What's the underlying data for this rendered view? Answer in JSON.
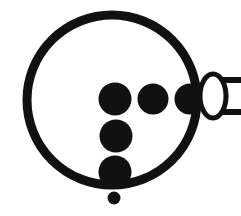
{
  "figure": {
    "title": "Circular pictogram with dot cluster and handle",
    "width": 241,
    "height": 216,
    "background_color": "#ffffff",
    "ink_color": "#111111"
  },
  "shapes": {
    "outer_circle": {
      "label": "outer circle outline",
      "cx": 112,
      "cy": 100,
      "r": 85,
      "stroke_width": 9,
      "fill": "none",
      "stroke": "#111111"
    },
    "dots": [
      {
        "label": "dot row one left",
        "cx": 115,
        "cy": 99,
        "r": 16.5,
        "fill": "#111111"
      },
      {
        "label": "dot row one middle",
        "cx": 153,
        "cy": 99,
        "r": 15.5,
        "fill": "#111111"
      },
      {
        "label": "dot row one right",
        "cx": 190,
        "cy": 99,
        "r": 15.5,
        "fill": "#111111"
      },
      {
        "label": "dot row two",
        "cx": 116,
        "cy": 136,
        "r": 16.5,
        "fill": "#111111"
      },
      {
        "label": "dot row three",
        "cx": 115,
        "cy": 172,
        "r": 16.5,
        "fill": "#111111"
      },
      {
        "label": "small dot below circle",
        "cx": 114,
        "cy": 198,
        "r": 6.5,
        "fill": "#111111"
      }
    ],
    "handle_ellipse": {
      "label": "handle ellipse",
      "cx": 213,
      "cy": 96,
      "rx": 13,
      "ry": 22,
      "fill": "#ffffff",
      "stroke": "#111111",
      "stroke_width": 5
    },
    "handle_bar": {
      "label": "handle bar",
      "x": 213,
      "y": 80,
      "width": 40,
      "height": 32,
      "fill": "#ffffff",
      "stroke": "#111111",
      "stroke_width": 6
    }
  }
}
